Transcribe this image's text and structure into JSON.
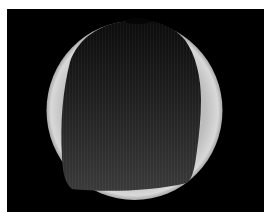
{
  "image": {
    "description": "Grayscale circular microscope/endoscope view: bright crescent rim around a large dark central region on a black background",
    "background_color": "#000000",
    "rim_color": "#cfcfcf",
    "inner_color": "#2a2a2a"
  }
}
